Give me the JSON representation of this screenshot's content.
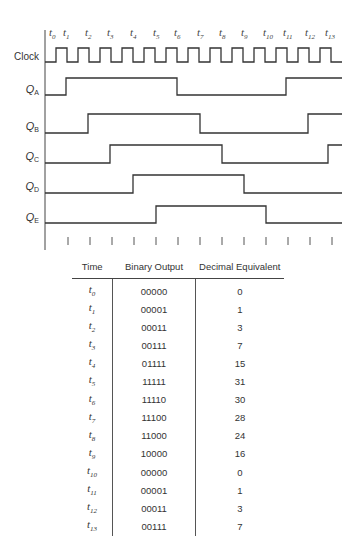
{
  "diagram": {
    "time_labels": [
      "t0",
      "t1",
      "t2",
      "t3",
      "t4",
      "t5",
      "t6",
      "t7",
      "t8",
      "t9",
      "t10",
      "t11",
      "t12",
      "t13"
    ],
    "signals": [
      {
        "name": "Clock",
        "main": "Clock",
        "sub": ""
      },
      {
        "name": "QA",
        "main": "Q",
        "sub": "A",
        "states": [
          0,
          1,
          1,
          1,
          1,
          1,
          0,
          0,
          0,
          0,
          0,
          1,
          1,
          1
        ]
      },
      {
        "name": "QB",
        "main": "Q",
        "sub": "B",
        "states": [
          0,
          0,
          1,
          1,
          1,
          1,
          1,
          0,
          0,
          0,
          0,
          0,
          1,
          1
        ]
      },
      {
        "name": "QC",
        "main": "Q",
        "sub": "C",
        "states": [
          0,
          0,
          0,
          1,
          1,
          1,
          1,
          1,
          0,
          0,
          0,
          0,
          0,
          1
        ]
      },
      {
        "name": "QD",
        "main": "Q",
        "sub": "D",
        "states": [
          0,
          0,
          0,
          0,
          1,
          1,
          1,
          1,
          1,
          0,
          0,
          0,
          0,
          0
        ]
      },
      {
        "name": "QE",
        "main": "Q",
        "sub": "E",
        "states": [
          0,
          0,
          0,
          0,
          0,
          1,
          1,
          1,
          1,
          1,
          0,
          0,
          0,
          0
        ]
      }
    ]
  },
  "table": {
    "headers": [
      "Time",
      "Binary Output",
      "Decimal Equivalent"
    ],
    "rows": [
      {
        "time": "t",
        "sub": "0",
        "binary": "00000",
        "decimal": "0"
      },
      {
        "time": "t",
        "sub": "1",
        "binary": "00001",
        "decimal": "1"
      },
      {
        "time": "t",
        "sub": "2",
        "binary": "00011",
        "decimal": "3"
      },
      {
        "time": "t",
        "sub": "3",
        "binary": "00111",
        "decimal": "7"
      },
      {
        "time": "t",
        "sub": "4",
        "binary": "01111",
        "decimal": "15"
      },
      {
        "time": "t",
        "sub": "5",
        "binary": "11111",
        "decimal": "31"
      },
      {
        "time": "t",
        "sub": "6",
        "binary": "11110",
        "decimal": "30"
      },
      {
        "time": "t",
        "sub": "7",
        "binary": "11100",
        "decimal": "28"
      },
      {
        "time": "t",
        "sub": "8",
        "binary": "11000",
        "decimal": "24"
      },
      {
        "time": "t",
        "sub": "9",
        "binary": "10000",
        "decimal": "16"
      },
      {
        "time": "t",
        "sub": "10",
        "binary": "00000",
        "decimal": "0"
      },
      {
        "time": "t",
        "sub": "11",
        "binary": "00001",
        "decimal": "1"
      },
      {
        "time": "t",
        "sub": "12",
        "binary": "00011",
        "decimal": "3"
      },
      {
        "time": "t",
        "sub": "13",
        "binary": "00111",
        "decimal": "7"
      }
    ]
  }
}
